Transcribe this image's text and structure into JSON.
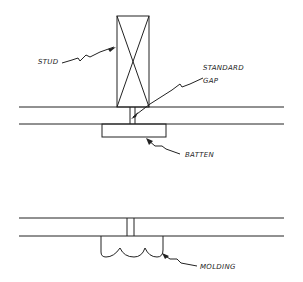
{
  "diagram": {
    "labels": {
      "stud": "STUD",
      "standard_gap_line1": "STANDARD",
      "standard_gap_line2": "GAP",
      "batten": "BATTEN",
      "molding": "MOLDING"
    },
    "colors": {
      "ink": "#222222",
      "background": "#ffffff"
    }
  }
}
